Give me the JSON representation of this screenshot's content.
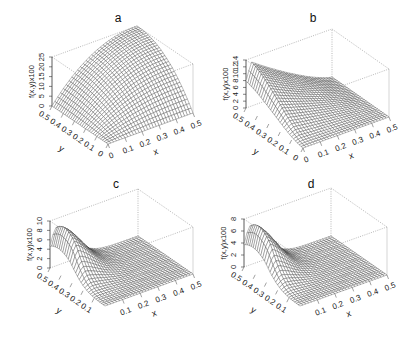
{
  "chart_data": [
    {
      "type": "surface",
      "title": "a",
      "xlabel": "x",
      "ylabel": "y",
      "zlabel": "f(x,y)x100",
      "xlim": [
        0,
        0.5
      ],
      "ylim": [
        0,
        0.5
      ],
      "zlim": [
        0,
        25
      ],
      "x_ticks": [
        "0",
        "0.1",
        "0.2",
        "0.3",
        "0.4",
        "0.5"
      ],
      "y_ticks": [
        "0",
        "0.1",
        "0.2",
        "0.3",
        "0.4",
        "0.5"
      ],
      "z_ticks": [
        "0",
        "5",
        "10",
        "15",
        "20",
        "25"
      ],
      "shape": "dome rising from 0 at x=0 and y=0 to a flat maximum near 25 toward x=0.5, y=0.5",
      "peak": {
        "x": 0.5,
        "y": 0.5,
        "z": 25
      }
    },
    {
      "type": "surface",
      "title": "b",
      "xlabel": "x",
      "ylabel": "y",
      "zlabel": "f(x,y)x100",
      "xlim": [
        0,
        0.5
      ],
      "ylim": [
        0,
        0.5
      ],
      "zlim": [
        0,
        14
      ],
      "x_ticks": [
        "0",
        "0.1",
        "0.2",
        "0.3",
        "0.4",
        "0.5"
      ],
      "y_ticks": [
        "0",
        "0.1",
        "0.2",
        "0.3",
        "0.4",
        "0.5"
      ],
      "z_ticks": [
        "0",
        "2",
        "4",
        "6",
        "8",
        "10",
        "12",
        "14"
      ],
      "shape": "ridge along high y, maximum near 14 at small x, decreasing toward x=0.5",
      "peak": {
        "x": 0.05,
        "y": 0.5,
        "z": 14
      }
    },
    {
      "type": "surface",
      "title": "c",
      "xlabel": "x",
      "ylabel": "y",
      "zlabel": "f(x,y)x100",
      "xlim": [
        0,
        0.5
      ],
      "ylim": [
        0,
        0.5
      ],
      "zlim": [
        0,
        10
      ],
      "x_ticks": [
        "0.1",
        "0.2",
        "0.3",
        "0.4",
        "0.5"
      ],
      "y_ticks": [
        "0.1",
        "0.2",
        "0.3",
        "0.4",
        "0.5"
      ],
      "z_ticks": [
        "0",
        "2",
        "4",
        "6",
        "8",
        "10"
      ],
      "shape": "sharp hump near x=0, y~0.4 decaying rapidly to near 0 for x>0.2",
      "peak": {
        "x": 0.02,
        "y": 0.42,
        "z": 9.5
      }
    },
    {
      "type": "surface",
      "title": "d",
      "xlabel": "x",
      "ylabel": "y",
      "zlabel": "f(x,y)x100",
      "xlim": [
        0,
        0.5
      ],
      "ylim": [
        0,
        0.5
      ],
      "zlim": [
        0,
        8
      ],
      "x_ticks": [
        "0.1",
        "0.2",
        "0.3",
        "0.4",
        "0.5"
      ],
      "y_ticks": [
        "0.1",
        "0.2",
        "0.3",
        "0.4",
        "0.5"
      ],
      "z_ticks": [
        "0",
        "2",
        "4",
        "6",
        "8"
      ],
      "shape": "sharp hump near x=0, y~0.4 decaying rapidly to near 0 for x>0.2",
      "peak": {
        "x": 0.02,
        "y": 0.42,
        "z": 7.5
      }
    }
  ]
}
